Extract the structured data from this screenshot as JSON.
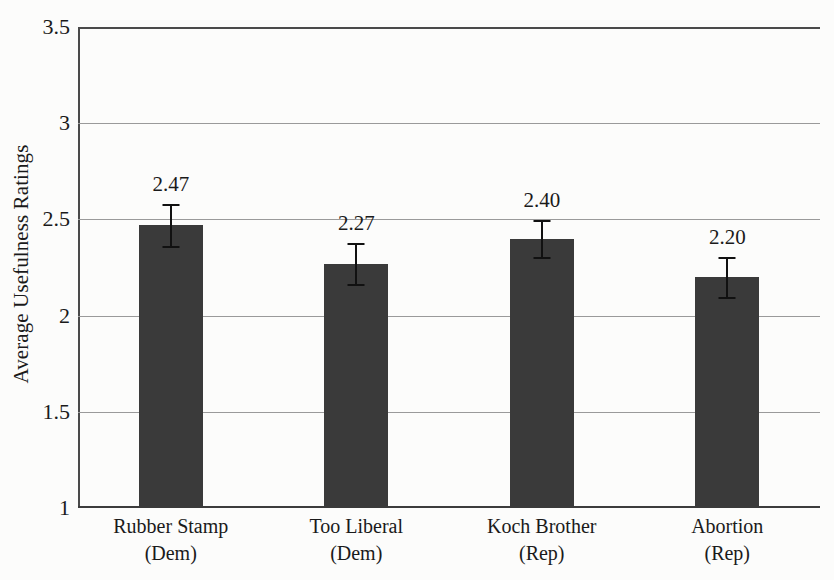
{
  "chart_data": {
    "type": "bar",
    "title": "",
    "xlabel": "",
    "ylabel": "Average Usefulness Ratings",
    "ylim": [
      1,
      3.5
    ],
    "yticks": [
      "1",
      "1.5",
      "2",
      "2.5",
      "3",
      "3.5"
    ],
    "ytick_values": [
      1,
      1.5,
      2,
      2.5,
      3,
      3.5
    ],
    "grid": "horizontal",
    "legend": "none",
    "bar_color": "#3a3a3a",
    "error_bar_color": "#111111",
    "categories": [
      "Rubber Stamp (Dem)",
      "Too Liberal (Dem)",
      "Koch Brother (Rep)",
      "Abortion (Rep)"
    ],
    "values": [
      2.47,
      2.27,
      2.4,
      2.2
    ],
    "value_labels": [
      "2.47",
      "2.27",
      "2.40",
      "2.20"
    ],
    "errors": [
      0.11,
      0.105,
      0.095,
      0.105
    ],
    "bars": [
      {
        "name": "Rubber Stamp (Dem)",
        "line1": "Rubber Stamp",
        "line2": "(Dem)",
        "value": 2.47,
        "label": "2.47",
        "error": 0.11
      },
      {
        "name": "Too Liberal (Dem)",
        "line1": "Too Liberal",
        "line2": "(Dem)",
        "value": 2.27,
        "label": "2.27",
        "error": 0.105
      },
      {
        "name": "Koch Brother (Rep)",
        "line1": "Koch Brother",
        "line2": "(Rep)",
        "value": 2.4,
        "label": "2.40",
        "error": 0.095
      },
      {
        "name": "Abortion (Rep)",
        "line1": "Abortion",
        "line2": "(Rep)",
        "value": 2.2,
        "label": "2.20",
        "error": 0.105
      }
    ]
  }
}
